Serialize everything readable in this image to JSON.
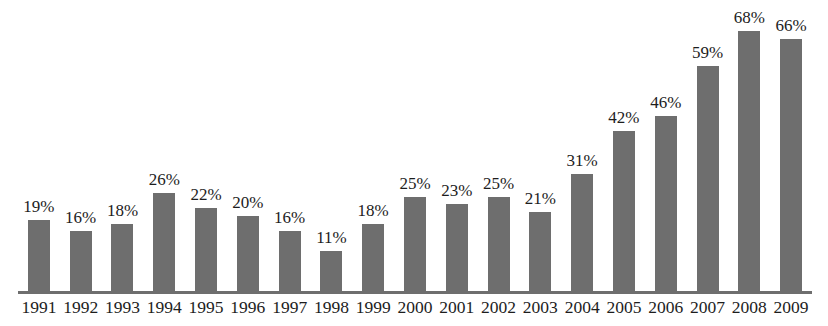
{
  "chart_data": {
    "type": "bar",
    "title": "",
    "subtitle": "",
    "xlabel": "",
    "ylabel": "",
    "categories": [
      "1991",
      "1992",
      "1993",
      "1994",
      "1995",
      "1996",
      "1997",
      "1998",
      "1999",
      "2000",
      "2001",
      "2002",
      "2003",
      "2004",
      "2005",
      "2006",
      "2007",
      "2008",
      "2009"
    ],
    "values": [
      19,
      16,
      18,
      26,
      22,
      20,
      16,
      11,
      18,
      25,
      23,
      25,
      21,
      31,
      42,
      46,
      59,
      68,
      66
    ],
    "value_labels": [
      "19%",
      "16%",
      "18%",
      "26%",
      "22%",
      "20%",
      "16%",
      "11%",
      "18%",
      "25%",
      "23%",
      "25%",
      "21%",
      "31%",
      "42%",
      "46%",
      "59%",
      "68%",
      "66%"
    ],
    "ylim": [
      0,
      72
    ],
    "grid": false,
    "legend": "none",
    "axis": {
      "x_axis_visible": true,
      "y_axis_visible": false,
      "tick_marks": false
    },
    "units": "percent",
    "colors": {
      "bar": "#6e6e6e",
      "axis": "#6e6e6e",
      "label_text": "#1d1d1d",
      "background": "#ffffff"
    }
  }
}
